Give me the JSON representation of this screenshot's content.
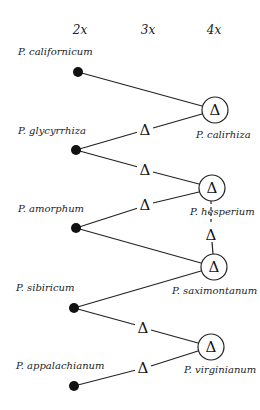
{
  "headers": [
    {
      "label": "2x",
      "x": 80,
      "y": 34
    },
    {
      "label": "3x",
      "x": 148,
      "y": 34
    },
    {
      "label": "4x",
      "x": 214,
      "y": 34
    }
  ],
  "diploids": [
    {
      "id": "cal",
      "label": "P. californicum",
      "x": 78,
      "y": 72,
      "lx": 18,
      "ly": 52
    },
    {
      "id": "gly",
      "label": "P. glycyrrhiza",
      "x": 76,
      "y": 150,
      "lx": 18,
      "ly": 131
    },
    {
      "id": "amo",
      "label": "P. amorphum",
      "x": 76,
      "y": 228,
      "lx": 18,
      "ly": 209
    },
    {
      "id": "sib",
      "label": "P. sibiricum",
      "x": 74,
      "y": 308,
      "lx": 16,
      "ly": 289
    },
    {
      "id": "app",
      "label": "P. appalachianum",
      "x": 74,
      "y": 386,
      "lx": 16,
      "ly": 366
    }
  ],
  "tetraploids": [
    {
      "id": "calr",
      "label": "P. calirhiza",
      "x": 215,
      "y": 110,
      "lx": 196,
      "ly": 136
    },
    {
      "id": "hes",
      "label": "P. hesperium",
      "x": 212,
      "y": 188,
      "lx": 190,
      "ly": 213
    },
    {
      "id": "sax",
      "label": "P. saximontanum",
      "x": 214,
      "y": 267,
      "lx": 172,
      "ly": 292
    },
    {
      "id": "vir",
      "label": "P. virginianum",
      "x": 211,
      "y": 347,
      "lx": 184,
      "ly": 371
    }
  ],
  "triploids": [
    {
      "id": "t1",
      "x": 145,
      "y": 130
    },
    {
      "id": "t2",
      "x": 145,
      "y": 170
    },
    {
      "id": "t3",
      "x": 145,
      "y": 205
    },
    {
      "id": "t4",
      "x": 143,
      "y": 328
    },
    {
      "id": "t5",
      "x": 143,
      "y": 368
    },
    {
      "id": "t6",
      "x": 211,
      "y": 234
    }
  ],
  "symbol": "Δ"
}
